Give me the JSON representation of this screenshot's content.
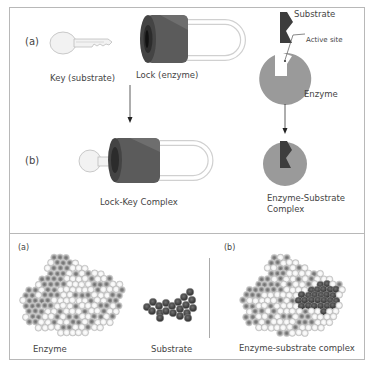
{
  "top_panel": {
    "row_a": {
      "tag": "(a)",
      "key_label": "Key (substrate)",
      "lock_label": "Lock (enzyme)",
      "substrate_label": "Substrate",
      "active_site_label": "Active site",
      "enzyme_label": "Enzyme"
    },
    "row_b": {
      "tag": "(b)",
      "lock_key_label": "Lock-Key Complex",
      "es_complex_label_line1": "Enzyme-Substrate",
      "es_complex_label_line2": "Complex"
    }
  },
  "bottom_panel": {
    "left": {
      "tag": "(a)",
      "enzyme_label": "Enzyme",
      "substrate_label": "Substrate"
    },
    "right": {
      "tag": "(b)",
      "complex_label": "Enzyme-substrate complex"
    }
  },
  "colors": {
    "lock_body": "#5a5a5a",
    "lock_dark": "#3a3a3a",
    "enzyme_fill": "#9a9a9a",
    "substrate_fill": "#3d3d3d",
    "frame": "#b8b8b8"
  }
}
